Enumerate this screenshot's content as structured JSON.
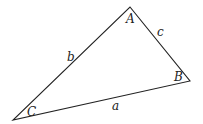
{
  "diagram": {
    "type": "triangle",
    "stroke_color": "#222222",
    "vertices": [
      {
        "label": "A",
        "x": 130,
        "y": 7,
        "label_x": 126,
        "label_y": 23
      },
      {
        "label": "B",
        "x": 190,
        "y": 81,
        "label_x": 174,
        "label_y": 81
      },
      {
        "label": "C",
        "x": 13,
        "y": 120,
        "label_x": 27,
        "label_y": 116
      }
    ],
    "sides": [
      {
        "label": "a",
        "between": "B-C",
        "label_x": 112,
        "label_y": 110
      },
      {
        "label": "b",
        "between": "A-C",
        "label_x": 67,
        "label_y": 61
      },
      {
        "label": "c",
        "between": "A-B",
        "label_x": 157,
        "label_y": 36
      }
    ]
  }
}
